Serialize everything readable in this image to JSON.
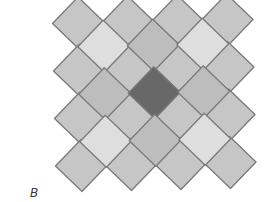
{
  "figure": {
    "label": "B",
    "label_pos": {
      "x": 30,
      "y": 186
    },
    "stroke_color": "#7a7a7a",
    "colors": {
      "outer": "#c6c6c6",
      "light": "#dedede",
      "medium": "#bdbdbd",
      "center": "#686868"
    },
    "lattice": {
      "origin": {
        "x": 78.5,
        "y": 23
      },
      "col_step": {
        "x": 49.5,
        "y": -1
      },
      "row_step": {
        "x": 1,
        "y": 47.5
      },
      "half_diag": 26
    },
    "outer_grid": {
      "rows": 4,
      "cols": 4,
      "tone": [
        [
          "outer",
          "outer",
          "outer",
          "outer"
        ],
        [
          "outer",
          "outer",
          "outer",
          "outer"
        ],
        [
          "outer",
          "outer",
          "outer",
          "outer"
        ],
        [
          "outer",
          "outer",
          "outer",
          "outer"
        ]
      ]
    },
    "inner_grid": {
      "rows": 3,
      "cols": 3,
      "tone": [
        [
          "light",
          "medium",
          "light"
        ],
        [
          "medium",
          "center",
          "medium"
        ],
        [
          "light",
          "medium",
          "light"
        ]
      ]
    }
  }
}
